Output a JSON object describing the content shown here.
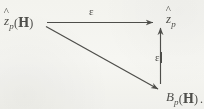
{
  "document": {
    "kind": "mathematical-diagram",
    "description": "Commutative triangle diagram with three nodes and three arrows"
  },
  "nodes": {
    "source": {
      "name": "z-hat-p-of-H",
      "base": "z",
      "accent": "^",
      "subscript": "p",
      "open_paren": "(",
      "argument": "H",
      "close_paren": ")",
      "trailing": ""
    },
    "target_top": {
      "name": "z-hat-p",
      "base": "z",
      "accent": "^",
      "subscript": "p",
      "open_paren": "",
      "argument": "",
      "close_paren": "",
      "trailing": ""
    },
    "target_bottom": {
      "name": "B-p-of-H",
      "base": "B",
      "accent": "",
      "subscript": "p",
      "open_paren": "(",
      "argument": "H",
      "close_paren": ")",
      "trailing": "."
    }
  },
  "edges": {
    "horizontal": {
      "name": "epsilon-horizontal",
      "label": "ε",
      "from": "source",
      "to": "target_top",
      "direction": "right"
    },
    "diagonal": {
      "name": "diagonal-unlabeled",
      "label": "",
      "from": "source",
      "to": "target_bottom",
      "direction": "down-right"
    },
    "vertical": {
      "name": "epsilon-bar-vertical",
      "label": "ε",
      "mark": "|",
      "from": "target_bottom",
      "to": "target_top",
      "direction": "up"
    }
  },
  "style": {
    "ink": "#4a4a46",
    "paper": "#fdfdfb"
  }
}
